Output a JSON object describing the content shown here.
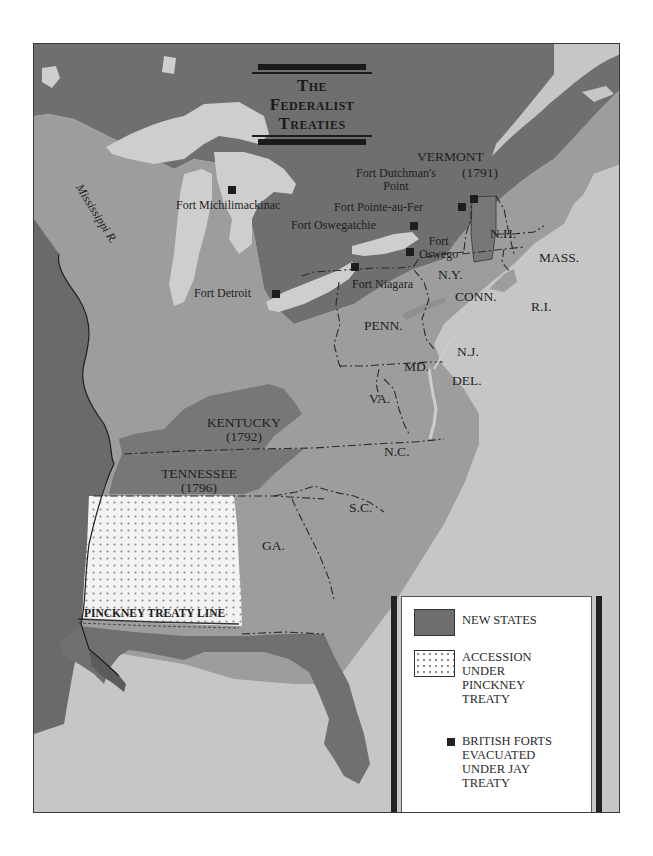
{
  "title": {
    "line1": "The",
    "line2": "Federalist",
    "line3": "Treaties"
  },
  "colors": {
    "british_territory": "#6f6f6f",
    "united_states": "#9e9e9e",
    "new_states": "#757575",
    "water": "#c8c8c8",
    "pinckney_accession": "#f4f4f4",
    "fort_marker": "#1d1d1d",
    "text": "#1e1e1e"
  },
  "map": {
    "rivers": [
      {
        "label": "Mississippi R."
      }
    ],
    "states": [
      {
        "id": "vermont",
        "label": "VERMONT",
        "year": "(1791)",
        "new_state": true
      },
      {
        "id": "kentucky",
        "label": "KENTUCKY",
        "year": "(1792)",
        "new_state": true
      },
      {
        "id": "tennessee",
        "label": "TENNESSEE",
        "year": "(1796)",
        "new_state": true
      },
      {
        "id": "nh",
        "label": "N.H."
      },
      {
        "id": "mass",
        "label": "MASS."
      },
      {
        "id": "ny",
        "label": "N.Y."
      },
      {
        "id": "conn",
        "label": "CONN."
      },
      {
        "id": "ri",
        "label": "R.I."
      },
      {
        "id": "penn",
        "label": "PENN."
      },
      {
        "id": "nj",
        "label": "N.J."
      },
      {
        "id": "md",
        "label": "MD."
      },
      {
        "id": "del",
        "label": "DEL."
      },
      {
        "id": "va",
        "label": "VA."
      },
      {
        "id": "nc",
        "label": "N.C."
      },
      {
        "id": "sc",
        "label": "S.C."
      },
      {
        "id": "ga",
        "label": "GA."
      }
    ],
    "forts": [
      {
        "label": "Fort Michilimackinac"
      },
      {
        "label": "Fort Detroit"
      },
      {
        "label": "Fort Niagara"
      },
      {
        "label": "Fort Oswego",
        "line1": "Fort",
        "line2": "Oswego"
      },
      {
        "label": "Fort Oswegatchie"
      },
      {
        "label": "Fort Pointe-au-Fer"
      },
      {
        "label": "Fort Dutchman's Point",
        "line1": "Fort Dutchman's",
        "line2": "Point"
      }
    ],
    "treaty_line": {
      "label": "PINCKNEY TREATY LINE"
    }
  },
  "legend": {
    "items": [
      {
        "id": "new-states",
        "label": "NEW STATES"
      },
      {
        "id": "pinckney",
        "lines": [
          "ACCESSION",
          "UNDER",
          "PINCKNEY",
          "TREATY"
        ]
      },
      {
        "id": "british-forts",
        "lines": [
          "BRITISH FORTS",
          "EVACUATED",
          "UNDER JAY",
          "TREATY"
        ]
      }
    ]
  }
}
